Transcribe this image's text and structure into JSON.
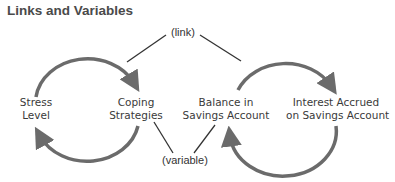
{
  "title": "Links and Variables",
  "labels": {
    "link": "(link)",
    "variable": "(variable)"
  },
  "nodes": {
    "stress_level": {
      "line1": "Stress",
      "line2": "Level"
    },
    "coping_strategies": {
      "line1": "Coping",
      "line2": "Strategies"
    },
    "balance": {
      "line1": "Balance in",
      "line2": "Savings Account"
    },
    "interest": {
      "line1": "Interest Accrued",
      "line2": "on Savings Account"
    }
  },
  "colors": {
    "arrow": "#6b6b6b",
    "line": "#333333",
    "text": "#3a3a3a"
  }
}
